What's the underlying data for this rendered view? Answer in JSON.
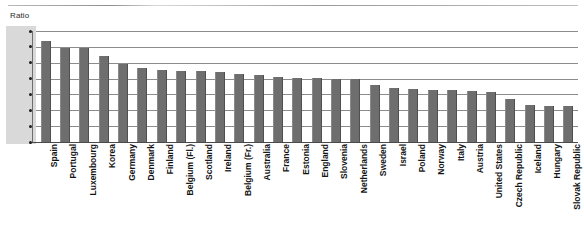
{
  "chart_data": {
    "type": "bar",
    "title": "",
    "subtitle": "",
    "ylabel": "Ratio",
    "xlabel": "",
    "ylim": [
      0.0,
      1.4
    ],
    "yticks": [
      "0.0",
      "0.2",
      "0.4",
      "0.6",
      "0.8",
      "1.0",
      "1.2",
      "1.4"
    ],
    "ytick_values": [
      0.0,
      0.2,
      0.4,
      0.6,
      0.8,
      1.0,
      1.2,
      1.4
    ],
    "grid": true,
    "legend": "none",
    "bar_color": "#6e6e6e",
    "categories": [
      "Spain",
      "Portugal",
      "Luxembourg",
      "Korea",
      "Germany",
      "Denmark",
      "Finland",
      "Belgium (Fl.)",
      "Scotland",
      "Ireland",
      "Belgium (Fr.)",
      "Australia",
      "France",
      "Estonia",
      "England",
      "Slovenia",
      "Netherlands",
      "Sweden",
      "Israel",
      "Poland",
      "Norway",
      "Italy",
      "Austria",
      "United States",
      "Czech Republic",
      "Iceland",
      "Hungary",
      "Slovak Republic"
    ],
    "values": [
      1.27,
      1.19,
      1.19,
      1.09,
      0.98,
      0.93,
      0.91,
      0.9,
      0.89,
      0.88,
      0.86,
      0.84,
      0.82,
      0.81,
      0.81,
      0.8,
      0.79,
      0.72,
      0.68,
      0.67,
      0.66,
      0.65,
      0.64,
      0.63,
      0.54,
      0.47,
      0.46,
      0.45
    ]
  }
}
